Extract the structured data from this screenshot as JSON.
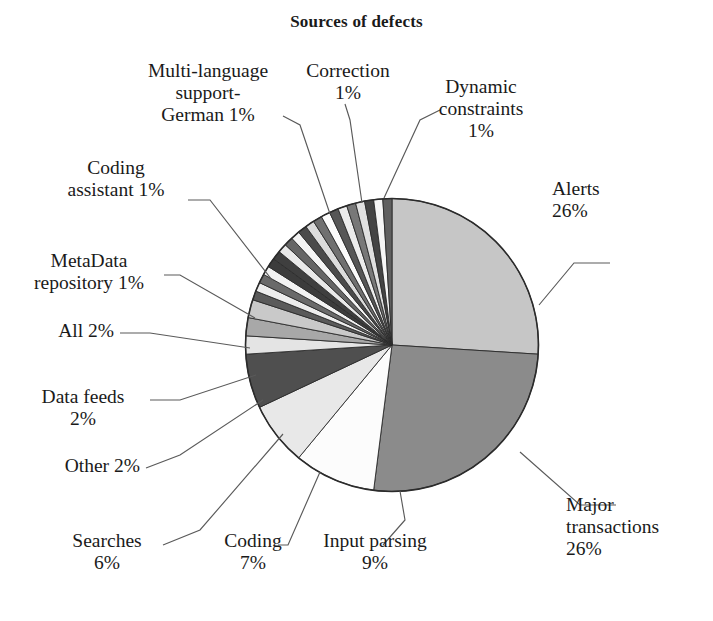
{
  "chart": {
    "title": "Sources of defects"
  },
  "chart_data": {
    "type": "pie",
    "title": "Sources of defects",
    "xlabel": "",
    "ylabel": "",
    "units": "percent",
    "legend": "none (direct labels with leader lines)",
    "grid": false,
    "start_angle_deg": 0,
    "direction": "clockwise",
    "labels": [
      "Alerts",
      "Major transactions",
      "Input parsing",
      "Coding",
      "Searches",
      "Other",
      "Data feeds",
      "All",
      "MetaData repository",
      "Coding assistant",
      "Multi-language support-German",
      "Correction",
      "Dynamic constraints"
    ],
    "values": [
      26,
      26,
      9,
      7,
      6,
      2,
      2,
      2,
      1,
      1,
      1,
      1,
      1
    ],
    "value_labels": [
      "26%",
      "26%",
      "9%",
      "7%",
      "6%",
      "2%",
      "2%",
      "2%",
      "1%",
      "1%",
      "1%",
      "1%",
      "1%"
    ],
    "colors": [
      "#c6c6c6",
      "#8b8b8b",
      "#fcfcfc",
      "#e8e8e8",
      "#4f4f4f",
      "#e4e4e4",
      "#a8a8a8",
      "#c9c9c9",
      "#5a5a5a",
      "#ededed",
      "#6a6a6a",
      "#f2f2f2",
      "#3c3c3c"
    ],
    "unlabeled_remainder_percent": 15,
    "unlabeled_remainder_note": "approximately fifteen additional thin ~1% wedges, unlabeled, alternating light and dark gray"
  },
  "labels": {
    "alerts": "Alerts\n26%",
    "major_transactions": "Major\ntransactions\n26%",
    "input_parsing": "Input parsing\n9%",
    "coding": "Coding\n7%",
    "searches": "Searches\n6%",
    "other": "Other 2%",
    "data_feeds": "Data feeds\n2%",
    "all": "All 2%",
    "metadata_repository": "MetaData\nrepository 1%",
    "coding_assistant": "Coding\nassistant 1%",
    "multi_language": "Multi-language\nsupport-\nGerman 1%",
    "correction": "Correction\n1%",
    "dynamic_constraints": "Dynamic\nconstraints\n1%"
  },
  "style": {
    "background": "#ffffff",
    "text_color": "#1a1a1a",
    "outline_color": "#2b2b2b",
    "leader_color": "#5a5a5a"
  }
}
